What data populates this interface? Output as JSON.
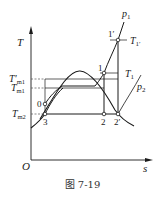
{
  "figure": {
    "caption": "图 7-19",
    "axes": {
      "y_label": "T",
      "x_label": "s",
      "origin_label": "O"
    },
    "pressure_labels": {
      "p1": "p",
      "p1_sub": "1",
      "p2": "p",
      "p2_sub": "2"
    },
    "temperature_labels": {
      "T1prime": "T",
      "T1prime_sub": "1′",
      "T1": "T",
      "T1_sub": "1",
      "Tm1prime": "T′",
      "Tm1prime_sub": "m1",
      "Tm1": "T",
      "Tm1_sub": "m1",
      "Tm2": "T",
      "Tm2_sub": "m2"
    },
    "points": {
      "p1prime": "1′",
      "p1": "1",
      "p0": "0",
      "p3": "3",
      "p2": "2",
      "p2prime": "2′"
    },
    "colors": {
      "line": "#1a1a1a",
      "dashed": "#555555"
    }
  }
}
